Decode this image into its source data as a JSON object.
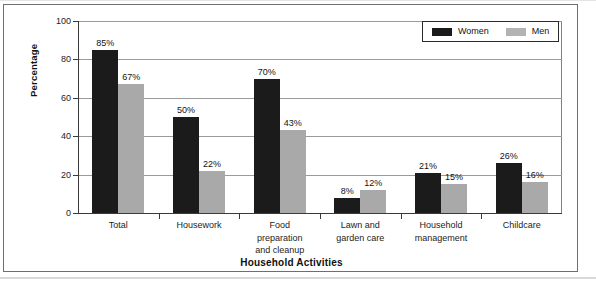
{
  "chart_data": {
    "type": "bar",
    "title": "",
    "xlabel": "Household Activities",
    "ylabel": "Percentage",
    "ylim": [
      0,
      100
    ],
    "yticks": [
      0,
      20,
      40,
      60,
      80,
      100
    ],
    "ytick_labels": [
      "0",
      "20",
      "40",
      "60",
      "80",
      "100"
    ],
    "grid": true,
    "legend_position": "top-right",
    "categories": [
      "Total",
      "Housework",
      "Food preparation and cleanup",
      "Lawn and garden care",
      "Household management",
      "Childcare"
    ],
    "category_lines": [
      [
        "Total"
      ],
      [
        "Housework"
      ],
      [
        "Food",
        "preparation",
        "and cleanup"
      ],
      [
        "Lawn and",
        "garden care"
      ],
      [
        "Household",
        "management"
      ],
      [
        "Childcare"
      ]
    ],
    "series": [
      {
        "name": "Women",
        "color": "#1b1b1b",
        "values": [
          85,
          50,
          70,
          8,
          21,
          26
        ],
        "labels": [
          "85%",
          "50%",
          "70%",
          "8%",
          "21%",
          "26%"
        ]
      },
      {
        "name": "Men",
        "color": "#a9a9a9",
        "values": [
          67,
          22,
          43,
          12,
          15,
          16
        ],
        "labels": [
          "67%",
          "22%",
          "43%",
          "12%",
          "15%",
          "16%"
        ]
      }
    ]
  },
  "legend": {
    "entries": [
      {
        "label": "Women",
        "color": "#1b1b1b"
      },
      {
        "label": "Men",
        "color": "#b3b3b3"
      }
    ]
  }
}
